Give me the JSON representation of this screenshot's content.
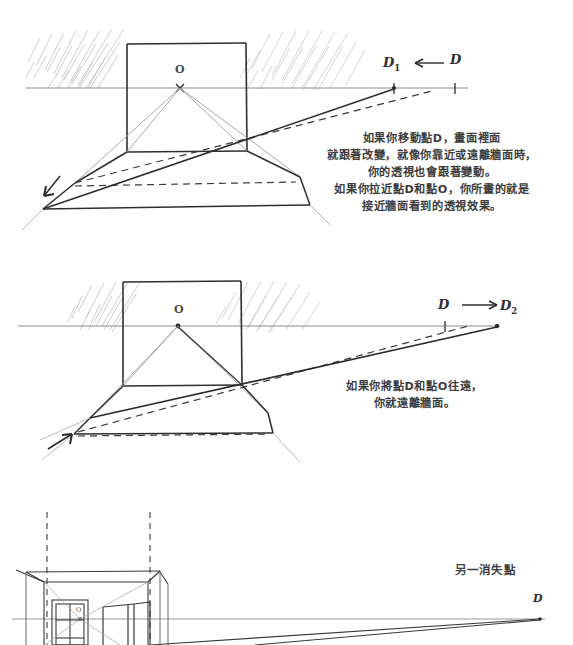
{
  "page": {
    "background_color": "#ffffff",
    "ink_color": "#333333",
    "pencil_color": "#9a9a9a"
  },
  "panel1": {
    "name": "移動點D向左",
    "vanishing_point_label": "O",
    "distance_point_moved_label": "D1",
    "distance_point_label": "D",
    "arrow_direction": "left",
    "note": [
      "如果你移動點D，畫面裡面",
      "就跟著改變，就像你靠近或遠離牆面時，",
      "你的透視也會跟著變動。",
      "如果你拉近點D和點O，你所畫的就是",
      "接近牆面看到的透視效果。"
    ]
  },
  "panel2": {
    "name": "移動點D向右",
    "vanishing_point_label": "O",
    "distance_point_label": "D",
    "distance_point_moved_label": "D2",
    "arrow_direction": "right",
    "note": [
      "如果你將點D和點O往遠，",
      "你就遠離牆面。"
    ]
  },
  "panel3": {
    "name": "室內空間範例",
    "vanishing_point_label": "O",
    "distance_point_label": "D",
    "annotation": "另一消失點"
  }
}
